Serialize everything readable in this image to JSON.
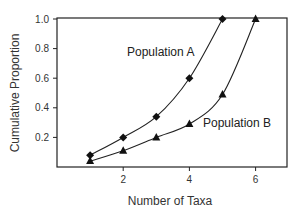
{
  "chart_data": {
    "type": "line",
    "title": "",
    "xlabel": "Number of Taxa",
    "ylabel": "Cumulative Proportion",
    "xlim": [
      0,
      7
    ],
    "ylim": [
      0,
      1.0
    ],
    "x_ticks": [
      "2",
      "4",
      "6"
    ],
    "y_ticks": [
      "0.2",
      "0.4",
      "0.6",
      "0.8",
      "1.0"
    ],
    "grid": false,
    "legend": "inline labels",
    "series": [
      {
        "name": "Population A",
        "marker": "diamond",
        "x": [
          1,
          2,
          3,
          4,
          5
        ],
        "values": [
          0.08,
          0.2,
          0.34,
          0.6,
          1.0
        ]
      },
      {
        "name": "Population B",
        "marker": "triangle",
        "x": [
          1,
          2,
          3,
          4,
          5,
          6
        ],
        "values": [
          0.04,
          0.11,
          0.2,
          0.29,
          0.49,
          1.0
        ]
      }
    ]
  }
}
